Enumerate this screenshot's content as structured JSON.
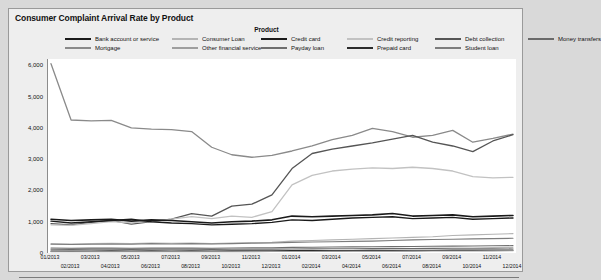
{
  "title": "Consumer Complaint Arrival Rate by Product",
  "legend": {
    "heading": "Product",
    "columns": [
      {
        "left": 56,
        "items": [
          {
            "label": "Bank account or service",
            "color": "#1a1a1a"
          },
          {
            "label": "Mortgage",
            "color": "#8a8a8a"
          }
        ]
      },
      {
        "left": 163,
        "items": [
          {
            "label": "Consumer Loan",
            "color": "#b4b4b4"
          },
          {
            "label": "Other financial service",
            "color": "#9e9e9e"
          }
        ]
      },
      {
        "left": 252,
        "items": [
          {
            "label": "Credit card",
            "color": "#1a1a1a"
          },
          {
            "label": "Payday loan",
            "color": "#6e6e6e"
          }
        ]
      },
      {
        "left": 338,
        "items": [
          {
            "label": "Credit reporting",
            "color": "#c2c2c2"
          },
          {
            "label": "Prepaid card",
            "color": "#2b2b2b"
          }
        ]
      },
      {
        "left": 426,
        "items": [
          {
            "label": "Debt collection",
            "color": "#555555"
          },
          {
            "label": "Student loan",
            "color": "#7d7d7d"
          }
        ]
      },
      {
        "left": 519,
        "items": [
          {
            "label": "Money transfers",
            "color": "#6a6a6a"
          }
        ]
      }
    ]
  },
  "chart_data": {
    "type": "line",
    "title": "Consumer Complaint Arrival Rate by Product",
    "xlabel": "",
    "ylabel": "",
    "ylim": [
      0,
      6200
    ],
    "yticks": [
      0,
      1000,
      2000,
      3000,
      4000,
      5000,
      6000
    ],
    "ytick_labels": [
      "0",
      "1,000",
      "2,000",
      "3,000",
      "4,000",
      "5,000",
      "6,000"
    ],
    "grid": false,
    "legend_position": "top",
    "categories": [
      "01/2013",
      "02/2013",
      "03/2013",
      "04/2013",
      "05/2013",
      "06/2013",
      "07/2013",
      "08/2013",
      "09/2013",
      "10/2013",
      "11/2013",
      "12/2013",
      "01/2014",
      "02/2014",
      "03/2014",
      "04/2014",
      "05/2014",
      "06/2014",
      "07/2014",
      "08/2014",
      "09/2014",
      "10/2014",
      "11/2014",
      "12/2014"
    ],
    "series": [
      {
        "name": "Mortgage",
        "color": "#8a8a8a",
        "width": 1.3,
        "values": [
          6050,
          4250,
          4220,
          4240,
          4000,
          3960,
          3940,
          3880,
          3380,
          3140,
          3060,
          3120,
          3260,
          3420,
          3620,
          3760,
          3980,
          3880,
          3700,
          3760,
          3920,
          3540,
          3660,
          3800
        ]
      },
      {
        "name": "Debt collection",
        "color": "#555555",
        "width": 1.3,
        "values": [
          940,
          900,
          980,
          1040,
          920,
          1000,
          1080,
          1260,
          1180,
          1500,
          1560,
          1860,
          2700,
          3180,
          3320,
          3420,
          3520,
          3640,
          3760,
          3540,
          3420,
          3240,
          3580,
          3780
        ]
      },
      {
        "name": "Credit reporting",
        "color": "#c2c2c2",
        "width": 1.3,
        "values": [
          900,
          880,
          940,
          1000,
          960,
          1020,
          1080,
          1160,
          1100,
          1180,
          1140,
          1320,
          2180,
          2480,
          2620,
          2680,
          2720,
          2700,
          2740,
          2700,
          2620,
          2440,
          2400,
          2420
        ]
      },
      {
        "name": "Bank account or service",
        "color": "#1a1a1a",
        "width": 1.6,
        "values": [
          1080,
          1040,
          1060,
          1080,
          1020,
          1060,
          1040,
          1000,
          960,
          1000,
          1020,
          1060,
          1180,
          1160,
          1180,
          1200,
          1220,
          1260,
          1180,
          1200,
          1220,
          1160,
          1180,
          1200
        ]
      },
      {
        "name": "Credit card",
        "color": "#1a1a1a",
        "width": 1.4,
        "values": [
          1020,
          960,
          1000,
          1040,
          1080,
          1000,
          960,
          940,
          900,
          920,
          940,
          980,
          1060,
          1040,
          1080,
          1120,
          1140,
          1160,
          1100,
          1120,
          1140,
          1080,
          1100,
          1120
        ]
      },
      {
        "name": "Consumer Loan",
        "color": "#b4b4b4",
        "width": 1.1,
        "values": [
          300,
          290,
          300,
          310,
          300,
          320,
          310,
          320,
          300,
          320,
          330,
          340,
          380,
          400,
          420,
          440,
          460,
          480,
          500,
          520,
          560,
          580,
          600,
          620
        ]
      },
      {
        "name": "Student loan",
        "color": "#7d7d7d",
        "width": 1.1,
        "values": [
          280,
          270,
          280,
          290,
          280,
          300,
          290,
          300,
          290,
          300,
          310,
          320,
          340,
          350,
          360,
          370,
          380,
          400,
          420,
          430,
          440,
          450,
          460,
          470
        ]
      },
      {
        "name": "Payday loan",
        "color": "#6e6e6e",
        "width": 1.1,
        "values": [
          160,
          150,
          155,
          160,
          150,
          160,
          155,
          160,
          150,
          160,
          165,
          170,
          180,
          185,
          190,
          195,
          200,
          205,
          210,
          215,
          220,
          225,
          230,
          235
        ]
      },
      {
        "name": "Money transfers",
        "color": "#6a6a6a",
        "width": 1.1,
        "values": [
          120,
          115,
          118,
          120,
          115,
          120,
          118,
          120,
          115,
          120,
          122,
          125,
          130,
          132,
          135,
          138,
          140,
          142,
          145,
          148,
          150,
          152,
          155,
          158
        ]
      },
      {
        "name": "Prepaid card",
        "color": "#2b2b2b",
        "width": 1.4,
        "values": [
          60,
          58,
          60,
          62,
          60,
          62,
          60,
          62,
          60,
          62,
          64,
          66,
          70,
          72,
          74,
          76,
          78,
          80,
          82,
          84,
          86,
          88,
          90,
          92
        ]
      },
      {
        "name": "Other financial service",
        "color": "#9e9e9e",
        "width": 1.1,
        "values": [
          40,
          38,
          40,
          42,
          40,
          42,
          40,
          42,
          40,
          42,
          44,
          46,
          48,
          50,
          52,
          54,
          56,
          58,
          60,
          62,
          64,
          66,
          68,
          70
        ]
      }
    ]
  }
}
